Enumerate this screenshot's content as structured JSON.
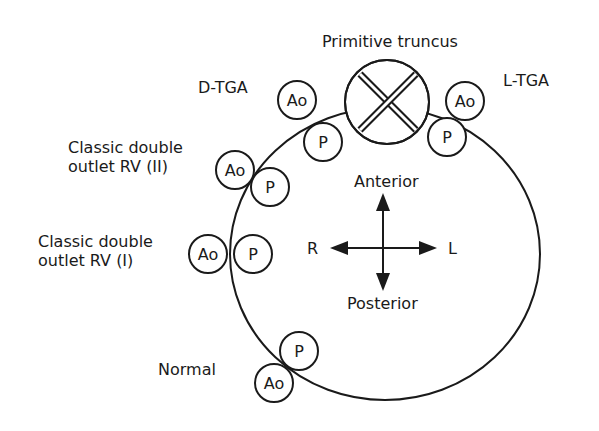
{
  "title_label": "Primitive truncus",
  "labels": {
    "d_tga": "D-TGA",
    "l_tga": "L-TGA",
    "classic_dorv_ii_line1": "Classic double",
    "classic_dorv_ii_line2": "outlet RV (II)",
    "classic_dorv_i_line1": "Classic double",
    "classic_dorv_i_line2": "outlet RV (I)",
    "normal": "Normal"
  },
  "vessels": {
    "aorta": "Ao",
    "pulmonary": "P"
  },
  "orientation": {
    "anterior": "Anterior",
    "posterior": "Posterior",
    "right": "R",
    "left": "L"
  },
  "colors": {
    "stroke": "#1a1a1a",
    "background": "#ffffff"
  }
}
